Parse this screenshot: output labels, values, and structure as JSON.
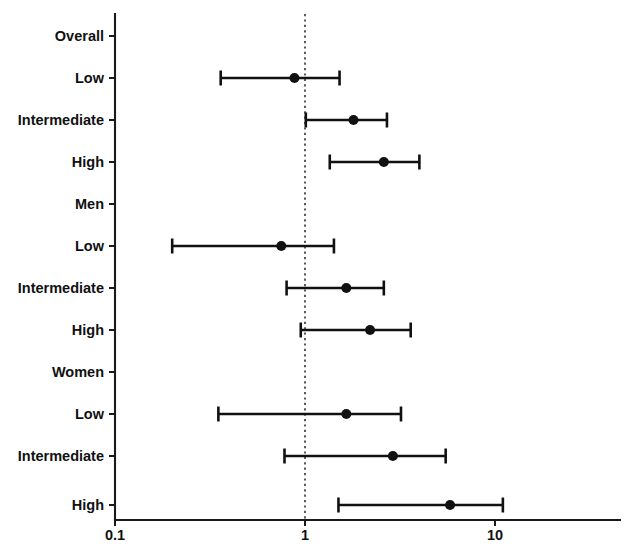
{
  "chart_data": {
    "type": "scatter",
    "subtype": "forest-plot",
    "title": "",
    "xlabel": "",
    "ylabel": "",
    "xscale": "log",
    "xlim": [
      0.1,
      17.5
    ],
    "xticks": [
      0.1,
      1,
      10
    ],
    "xtick_labels": [
      "0.1",
      "1",
      "10"
    ],
    "grid": false,
    "legend": null,
    "reference_line": 1,
    "axis_color": "#1a1a1a",
    "marker_color": "#111111",
    "categories": [
      "Overall",
      "Low",
      "Intermediate",
      "High",
      "Men",
      "Low",
      "Intermediate",
      "High",
      "Women",
      "Low",
      "Intermediate",
      "High"
    ],
    "rows": [
      {
        "label": "Overall",
        "is_header": true,
        "estimate": null,
        "ci_low": null,
        "ci_high": null
      },
      {
        "label": "Low",
        "is_header": false,
        "estimate": 0.88,
        "ci_low": 0.36,
        "ci_high": 1.52
      },
      {
        "label": "Intermediate",
        "is_header": false,
        "estimate": 1.8,
        "ci_low": 1.01,
        "ci_high": 2.7
      },
      {
        "label": "High",
        "is_header": false,
        "estimate": 2.6,
        "ci_low": 1.35,
        "ci_high": 4.0
      },
      {
        "label": "Men",
        "is_header": true,
        "estimate": null,
        "ci_low": null,
        "ci_high": null
      },
      {
        "label": "Low",
        "is_header": false,
        "estimate": 0.75,
        "ci_low": 0.2,
        "ci_high": 1.42
      },
      {
        "label": "Intermediate",
        "is_header": false,
        "estimate": 1.65,
        "ci_low": 0.8,
        "ci_high": 2.6
      },
      {
        "label": "High",
        "is_header": false,
        "estimate": 2.2,
        "ci_low": 0.95,
        "ci_high": 3.6
      },
      {
        "label": "Women",
        "is_header": true,
        "estimate": null,
        "ci_low": null,
        "ci_high": null
      },
      {
        "label": "Low",
        "is_header": false,
        "estimate": 1.65,
        "ci_low": 0.35,
        "ci_high": 3.2
      },
      {
        "label": "Intermediate",
        "is_header": false,
        "estimate": 2.9,
        "ci_low": 0.78,
        "ci_high": 5.5
      },
      {
        "label": "High",
        "is_header": false,
        "estimate": 5.8,
        "ci_low": 1.5,
        "ci_high": 11.0
      }
    ]
  }
}
